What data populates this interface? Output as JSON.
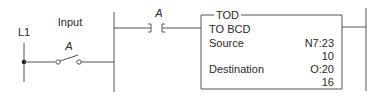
{
  "diagram": {
    "type": "ladder-logic",
    "rail_label": "L1",
    "input": {
      "label": "Input",
      "contact_label": "A",
      "contact_type": "pushbutton-normally-open"
    },
    "rung_contact": {
      "label": "A",
      "contact_type": "examine-if-closed"
    },
    "instruction": {
      "mnemonic": "TOD",
      "title": "TO BCD",
      "rows": [
        {
          "label": "Source",
          "value": "N7:23",
          "sub_value": "10"
        },
        {
          "label": "Destination",
          "value": "O:20",
          "sub_value": "16"
        }
      ]
    }
  }
}
